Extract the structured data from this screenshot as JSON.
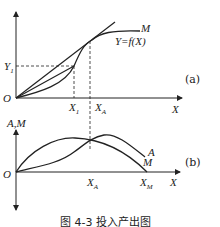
{
  "figure": {
    "caption": "图 4-3  投入产出图",
    "panel_a": {
      "tag": "(a)",
      "origin": "O",
      "x_axis_label": "X",
      "y_tick_label": "Y",
      "y_tick_sub": "1",
      "x_tick_1": "X",
      "x_tick_1_sub": "1",
      "x_tick_A": "X",
      "x_tick_A_sub": "A",
      "curve_label_M": "M",
      "curve_equation": "Y=f(X)"
    },
    "panel_b": {
      "tag": "(b)",
      "origin": "O",
      "y_axis_label": "A,M",
      "x_axis_label": "X",
      "x_tick_A": "X",
      "x_tick_A_sub": "A",
      "x_tick_M": "X",
      "x_tick_M_sub": "M",
      "curve_A_label": "A",
      "curve_M_label": "M"
    }
  },
  "colors": {
    "ink": "#222222",
    "background": "#ffffff"
  }
}
